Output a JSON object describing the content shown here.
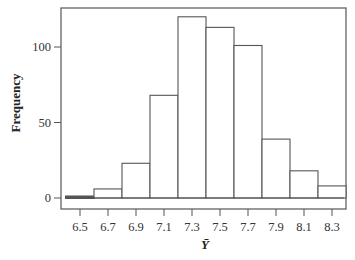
{
  "chart_data": {
    "type": "bar",
    "subtype": "histogram",
    "title": "",
    "xlabel": "Ȳ",
    "ylabel": "Frequency",
    "categories": [
      "6.5",
      "6.7",
      "6.9",
      "7.1",
      "7.3",
      "7.5",
      "7.7",
      "7.9",
      "8.1",
      "8.3"
    ],
    "bin_centers": [
      6.5,
      6.7,
      6.9,
      7.1,
      7.3,
      7.5,
      7.7,
      7.9,
      8.1,
      8.3
    ],
    "bin_width": 0.2,
    "values": [
      1,
      6,
      23,
      68,
      120,
      113,
      101,
      39,
      18,
      8
    ],
    "ylim": [
      0,
      125
    ],
    "yticks": [
      0,
      50,
      100
    ],
    "xticks": [
      "6.5",
      "6.7",
      "6.9",
      "7.1",
      "7.3",
      "7.5",
      "7.7",
      "7.9",
      "8.1",
      "8.3"
    ],
    "grid": false,
    "legend": null,
    "colors": {
      "bar_fill": "#ffffff",
      "bar_edge": "#555555",
      "frame": "#555555"
    }
  }
}
